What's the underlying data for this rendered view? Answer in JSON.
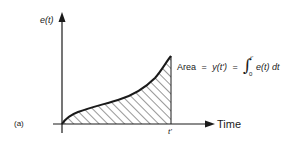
{
  "figure": {
    "panel_label": "(a)",
    "y_axis_label": "e(t)",
    "x_axis_label": "Time",
    "x_marker_label": "t'",
    "equation": {
      "lhs": "Area",
      "eq1": "=",
      "mid": "y(t')",
      "eq2": "=",
      "integral_symbol": "∫",
      "upper_limit": "t'",
      "lower_limit": "0",
      "integrand": "e(t) dt"
    },
    "shading": "diagonal-hatch",
    "colors": {
      "ink": "#1a1a1a",
      "background": "#ffffff"
    }
  }
}
